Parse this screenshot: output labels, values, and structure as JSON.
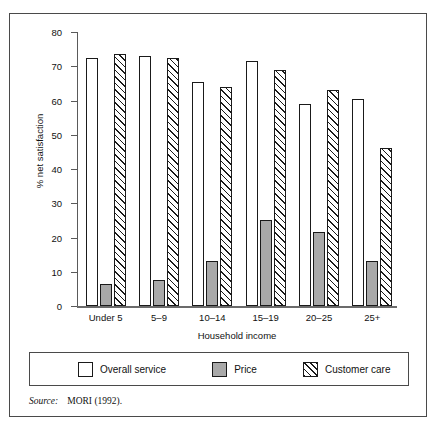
{
  "chart_data": {
    "type": "bar",
    "title": "",
    "xlabel": "Household income",
    "ylabel": "% net satisfaction",
    "categories": [
      "Under 5",
      "5–9",
      "10–14",
      "15–19",
      "20–25",
      "25+"
    ],
    "series": [
      {
        "name": "Overall service",
        "values": [
          72.5,
          73,
          65.5,
          71.5,
          59,
          60.5
        ],
        "fill": "white",
        "edge": "#1a1a1a"
      },
      {
        "name": "Price",
        "values": [
          6.5,
          7.5,
          13,
          25,
          21.5,
          13
        ],
        "fill": "#a9a9a9",
        "edge": "#1a1a1a"
      },
      {
        "name": "Customer care",
        "values": [
          73.5,
          72.5,
          64,
          69,
          63,
          46
        ],
        "fill": "hatch-diagonal",
        "edge": "#1a1a1a"
      }
    ],
    "ylim": [
      0,
      80
    ],
    "yticks": [
      0,
      10,
      20,
      30,
      40,
      50,
      60,
      70,
      80
    ],
    "ytick_labels": [
      "0",
      "10",
      "20",
      "30",
      "40",
      "50",
      "60",
      "70",
      "80"
    ],
    "grid": false,
    "legend_position": "bottom"
  },
  "legend": {
    "items": [
      {
        "label": "Overall service",
        "swatch": "white-square-icon"
      },
      {
        "label": "Price",
        "swatch": "gray-square-icon"
      },
      {
        "label": "Customer care",
        "swatch": "hatched-square-icon"
      }
    ]
  },
  "source": {
    "label": "Source:",
    "text": "MORI (1992)."
  }
}
